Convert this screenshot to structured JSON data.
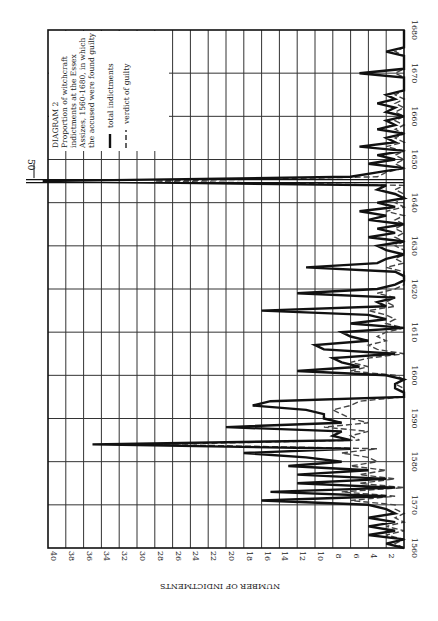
{
  "legend": {
    "title": "DIAGRAM 2",
    "lines": [
      "Proportion of witchcraft",
      "indictments at the Essex",
      "Assizes, 1560-1680, in which",
      "the accused were found guilty"
    ],
    "series_total_label": "total indictments",
    "series_guilty_label": "verdict of guilty"
  },
  "axes": {
    "value_axis_label": "NUMBER OF INDICTMENTS",
    "value_ticks": [
      "40",
      "38",
      "36",
      "34",
      "32",
      "30",
      "28",
      "26",
      "24",
      "22",
      "20",
      "18",
      "16",
      "14",
      "12",
      "10",
      "8",
      "6",
      "4",
      "2"
    ],
    "year_ticks": [
      "1560",
      "1570",
      "1580",
      "1590",
      "1600",
      "1610",
      "1620",
      "1630",
      "1640",
      "1650",
      "1660",
      "1670",
      "1680"
    ],
    "overflow_marker": "50"
  },
  "chart_data": {
    "type": "line",
    "orientation": "rotated 90° clockwise (years run bottom-to-top along right edge; values run right-to-left along bottom)",
    "xlabel": "Year",
    "ylabel": "NUMBER OF INDICTMENTS",
    "xlim": [
      1560,
      1680
    ],
    "ylim": [
      0,
      40
    ],
    "grid": true,
    "legend_position": "top-left (inside plot, upper portion)",
    "annotations": [
      {
        "x": 1645,
        "text": "50",
        "note": "1645 value exceeds axis, arrow marked 50"
      }
    ],
    "x": [
      1560,
      1561,
      1562,
      1563,
      1564,
      1565,
      1566,
      1567,
      1568,
      1569,
      1570,
      1571,
      1572,
      1573,
      1574,
      1575,
      1576,
      1577,
      1578,
      1579,
      1580,
      1581,
      1582,
      1583,
      1584,
      1585,
      1586,
      1587,
      1588,
      1589,
      1590,
      1591,
      1592,
      1593,
      1594,
      1595,
      1596,
      1597,
      1598,
      1599,
      1600,
      1601,
      1602,
      1603,
      1604,
      1605,
      1606,
      1607,
      1608,
      1609,
      1610,
      1611,
      1612,
      1613,
      1614,
      1615,
      1616,
      1617,
      1618,
      1619,
      1620,
      1621,
      1622,
      1623,
      1624,
      1625,
      1626,
      1627,
      1628,
      1629,
      1630,
      1631,
      1632,
      1633,
      1634,
      1635,
      1636,
      1637,
      1638,
      1639,
      1640,
      1641,
      1642,
      1643,
      1644,
      1645,
      1646,
      1647,
      1648,
      1649,
      1650,
      1651,
      1652,
      1653,
      1654,
      1655,
      1656,
      1657,
      1658,
      1659,
      1660,
      1661,
      1662,
      1663,
      1664,
      1665,
      1666,
      1667,
      1668,
      1669,
      1670,
      1671,
      1672,
      1673,
      1674,
      1675,
      1676,
      1677,
      1678,
      1679,
      1680
    ],
    "series": [
      {
        "name": "total indictments",
        "style": "solid",
        "values": [
          0,
          2,
          0,
          4,
          1,
          4,
          1,
          4,
          1,
          2,
          4,
          16,
          2,
          15,
          1,
          12,
          2,
          12,
          4,
          13,
          7,
          11,
          18,
          6,
          35,
          6,
          8,
          7,
          20,
          7,
          9,
          9,
          11,
          17,
          15,
          0,
          0,
          1,
          1,
          0,
          2,
          12,
          5,
          7,
          8,
          1,
          9,
          10,
          4,
          6,
          7,
          0,
          6,
          2,
          4,
          16,
          2,
          3,
          1,
          12,
          3,
          1,
          0,
          0,
          1,
          11,
          3,
          2,
          0,
          2,
          3,
          0,
          4,
          1,
          3,
          0,
          4,
          2,
          5,
          1,
          3,
          0,
          1,
          3,
          2,
          50,
          6,
          3,
          0,
          4,
          1,
          3,
          0,
          5,
          1,
          2,
          0,
          3,
          1,
          2,
          0,
          2,
          1,
          3,
          1,
          2,
          0,
          0,
          0,
          0,
          5,
          0,
          0,
          0,
          0,
          2,
          0,
          0,
          0,
          0,
          0
        ]
      },
      {
        "name": "verdict of guilty",
        "style": "dashed",
        "values": [
          0,
          1,
          0,
          2,
          0,
          2,
          0,
          1,
          0,
          1,
          1,
          6,
          1,
          7,
          0,
          5,
          1,
          5,
          2,
          6,
          3,
          4,
          7,
          3,
          28,
          5,
          6,
          4,
          9,
          4,
          6,
          7,
          8,
          6,
          5,
          0,
          0,
          0,
          1,
          0,
          1,
          6,
          4,
          6,
          4,
          0,
          3,
          4,
          2,
          3,
          2,
          0,
          2,
          1,
          2,
          4,
          1,
          2,
          1,
          3,
          1,
          0,
          0,
          0,
          0,
          2,
          0,
          1,
          0,
          0,
          1,
          0,
          1,
          0,
          1,
          0,
          1,
          0,
          2,
          0,
          1,
          0,
          0,
          1,
          0,
          28,
          3,
          2,
          0,
          1,
          0,
          1,
          0,
          2,
          0,
          1,
          0,
          1,
          0,
          1,
          0,
          1,
          0,
          1,
          0,
          1,
          0,
          0,
          0,
          0,
          1,
          0,
          0,
          0,
          0,
          1,
          0,
          0,
          0,
          0,
          0
        ]
      }
    ]
  }
}
